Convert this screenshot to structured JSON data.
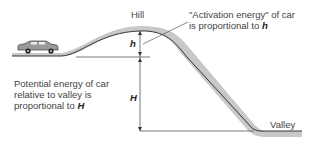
{
  "diagram": {
    "labels": {
      "hill": "Hill",
      "valley": "Valley",
      "h": "h",
      "H": "H"
    },
    "annotations": {
      "activation_line1": "\"Activation energy\" of car",
      "activation_line2_prefix": "is proportional to ",
      "activation_var": "h",
      "potential_line1": "Potential energy of car",
      "potential_line2": "relative to valley is",
      "potential_line3_prefix": "proportional to ",
      "potential_var": "H"
    },
    "colors": {
      "terrain_fill": "#c8c8c8",
      "terrain_line": "#222222",
      "dimension_line": "#555555"
    },
    "objects": [
      "car"
    ]
  }
}
